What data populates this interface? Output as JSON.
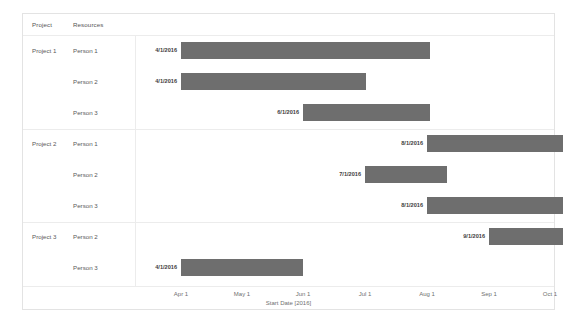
{
  "chart_data": {
    "type": "bar",
    "subtype": "gantt",
    "title": "",
    "xlabel": "Start Date [2016]",
    "ylabel": "",
    "grid": false,
    "legend": "none",
    "columns": [
      "Project",
      "Resources"
    ],
    "axis": {
      "title": "Start Date [2016]",
      "ticks": [
        "Apr 1",
        "May 1",
        "Jun 1",
        "Jul 1",
        "Aug 1",
        "Sep 1",
        "Oct 1"
      ],
      "tick_x": [
        45,
        106,
        167,
        229,
        291,
        353,
        414
      ],
      "range_start": "4/1/2016",
      "range_end": "10/15/2016"
    },
    "bar_color": "#6e6e6e",
    "groups": [
      {
        "project": "Project 1",
        "rows": [
          {
            "resource": "Person 1",
            "start_label": "4/1/2016",
            "start": 45,
            "end": 294
          },
          {
            "resource": "Person 2",
            "start_label": "4/1/2016",
            "start": 45,
            "end": 230
          },
          {
            "resource": "Person 3",
            "start_label": "6/1/2016",
            "start": 167,
            "end": 294
          }
        ]
      },
      {
        "project": "Project 2",
        "rows": [
          {
            "resource": "Person 1",
            "start_label": "8/1/2016",
            "start": 291,
            "end": 427
          },
          {
            "resource": "Person 2",
            "start_label": "7/1/2016",
            "start": 229,
            "end": 311
          },
          {
            "resource": "Person 3",
            "start_label": "8/1/2016",
            "start": 291,
            "end": 427
          }
        ]
      },
      {
        "project": "Project 3",
        "rows": [
          {
            "resource": "Person 2",
            "start_label": "9/1/2016",
            "start": 353,
            "end": 427
          },
          {
            "resource": "Person 3",
            "start_label": "4/1/2016",
            "start": 45,
            "end": 167
          }
        ]
      }
    ]
  }
}
